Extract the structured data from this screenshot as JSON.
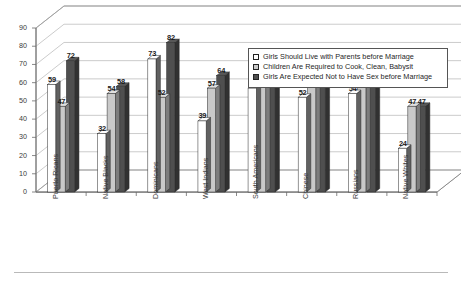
{
  "chart_data": {
    "type": "bar",
    "title": "",
    "subtitle": "",
    "xlabel": "",
    "ylabel": "",
    "ylim": [
      0,
      90
    ],
    "ytick_step": 10,
    "yticks": [
      "0",
      "10",
      "20",
      "30",
      "40",
      "50",
      "60",
      "70",
      "80",
      "90"
    ],
    "grid": true,
    "style": "3d-grouped-column",
    "legend_position": "inside-top-right",
    "categories": [
      "Puerto Ricans",
      "Native Blacks",
      "Dominicans",
      "West Indians",
      "South Americans",
      "Chinese",
      "Russians",
      "Native Whites"
    ],
    "series": [
      {
        "name": "Girls Should Live with Parents before Marriage",
        "color": "#ffffff",
        "values": [
          59,
          32,
          73,
          39,
          57,
          52,
          54,
          24
        ]
      },
      {
        "name": "Children Are Required to Cook, Clean, Babysit",
        "color": "#c9c9c9",
        "values": [
          47,
          54,
          52,
          57,
          67,
          65,
          61,
          47
        ]
      },
      {
        "name": "Girls Are Expected Not to Have Sex before Marriage",
        "color": "#4f4f4f",
        "values": [
          72,
          58,
          82,
          64,
          73,
          68,
          63,
          47
        ]
      }
    ]
  },
  "legend": {
    "items": [
      "Girls Should Live with Parents before Marriage",
      "Children Are Required to Cook, Clean, Babysit",
      "Girls Are Expected Not to Have Sex before Marriage"
    ]
  },
  "colors": {
    "series_1": "#ffffff",
    "series_2": "#c9c9c9",
    "series_3": "#4f4f4f",
    "axis": "#6b6b6b",
    "text": "#3a3a3a",
    "background": "#ffffff"
  }
}
